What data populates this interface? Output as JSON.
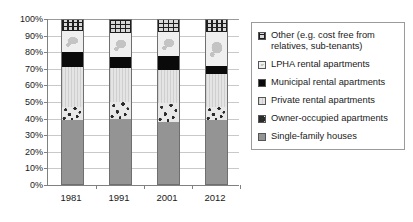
{
  "chart_data": {
    "type": "bar",
    "subtype": "stacked-100-percent",
    "title": "",
    "xlabel": "",
    "ylabel": "",
    "categories": [
      "1981",
      "1991",
      "2001",
      "2012"
    ],
    "ylim": [
      0,
      100
    ],
    "ytick_labels": [
      "0%",
      "10%",
      "20%",
      "30%",
      "40%",
      "50%",
      "60%",
      "70%",
      "80%",
      "90%",
      "100%"
    ],
    "ytick_values": [
      0,
      10,
      20,
      30,
      40,
      50,
      60,
      70,
      80,
      90,
      100
    ],
    "grid": true,
    "legend_position": "right",
    "series": [
      {
        "name": "Single-family houses",
        "key": "single",
        "pattern": "solid-gray",
        "color": "#949494",
        "values": [
          39,
          39.5,
          38,
          39
        ]
      },
      {
        "name": "Owner-occupied apartments",
        "key": "owner",
        "pattern": "speckled",
        "color": "#e8e8e8",
        "values": [
          8,
          10.5,
          11.5,
          8
        ]
      },
      {
        "name": "Private rental apartments",
        "key": "private",
        "pattern": "fine-vertical-lines",
        "color": "#dcdcdc",
        "values": [
          24,
          20.5,
          19.5,
          20
        ]
      },
      {
        "name": "Municipal rental apartments",
        "key": "municipal",
        "pattern": "solid-black",
        "color": "#0a0a0a",
        "values": [
          9,
          6.5,
          8.5,
          5
        ]
      },
      {
        "name": "LPHA rental apartments",
        "key": "lpha",
        "pattern": "light-mottled",
        "color": "#efefef",
        "values": [
          13,
          14.5,
          14.5,
          20
        ]
      },
      {
        "name": "Other (e.g. cost free from relatives, sub-tenants)",
        "key": "other",
        "pattern": "cross-hatch-dark",
        "color": "#d8d8d8",
        "values": [
          7,
          8.5,
          8,
          8
        ]
      }
    ]
  },
  "legend": {
    "items": [
      {
        "label": "Other (e.g. cost free from relatives, sub-tenants)",
        "key": "other"
      },
      {
        "label": "LPHA rental apartments",
        "key": "lpha"
      },
      {
        "label": "Municipal rental apartments",
        "key": "municipal"
      },
      {
        "label": "Private rental apartments",
        "key": "private"
      },
      {
        "label": "Owner-occupied apartments",
        "key": "owner"
      },
      {
        "label": "Single-family houses",
        "key": "single"
      }
    ]
  }
}
